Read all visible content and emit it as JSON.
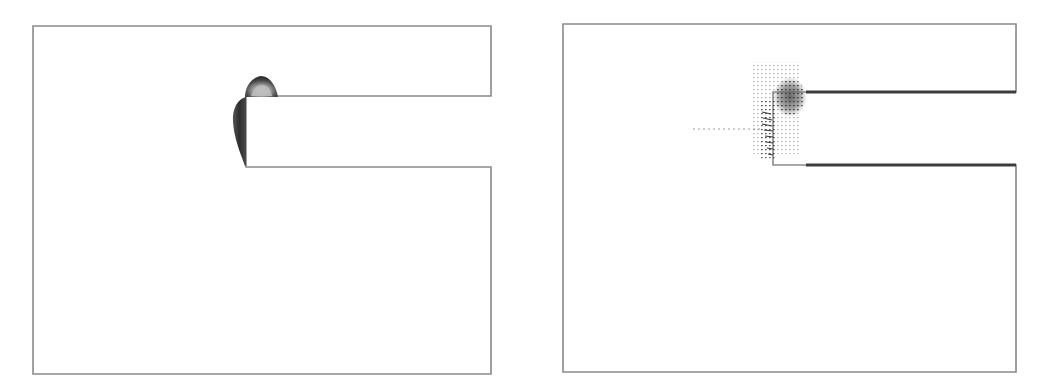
{
  "figure": {
    "panels": [
      {
        "id": "left",
        "kind": "contour-plot",
        "description": "Domain outline with shaded contour near re-entrant corner",
        "outline_color": "#8a8a8a",
        "contour_color": "#3a3a3a"
      },
      {
        "id": "right",
        "kind": "vector-field-plot",
        "description": "Domain outline with velocity vectors clustered around a vortex near the channel entrance",
        "outline_color": "#8a8a8a",
        "wall_color": "#3c3c3c",
        "vector_color": "#4a4a4a"
      }
    ]
  }
}
